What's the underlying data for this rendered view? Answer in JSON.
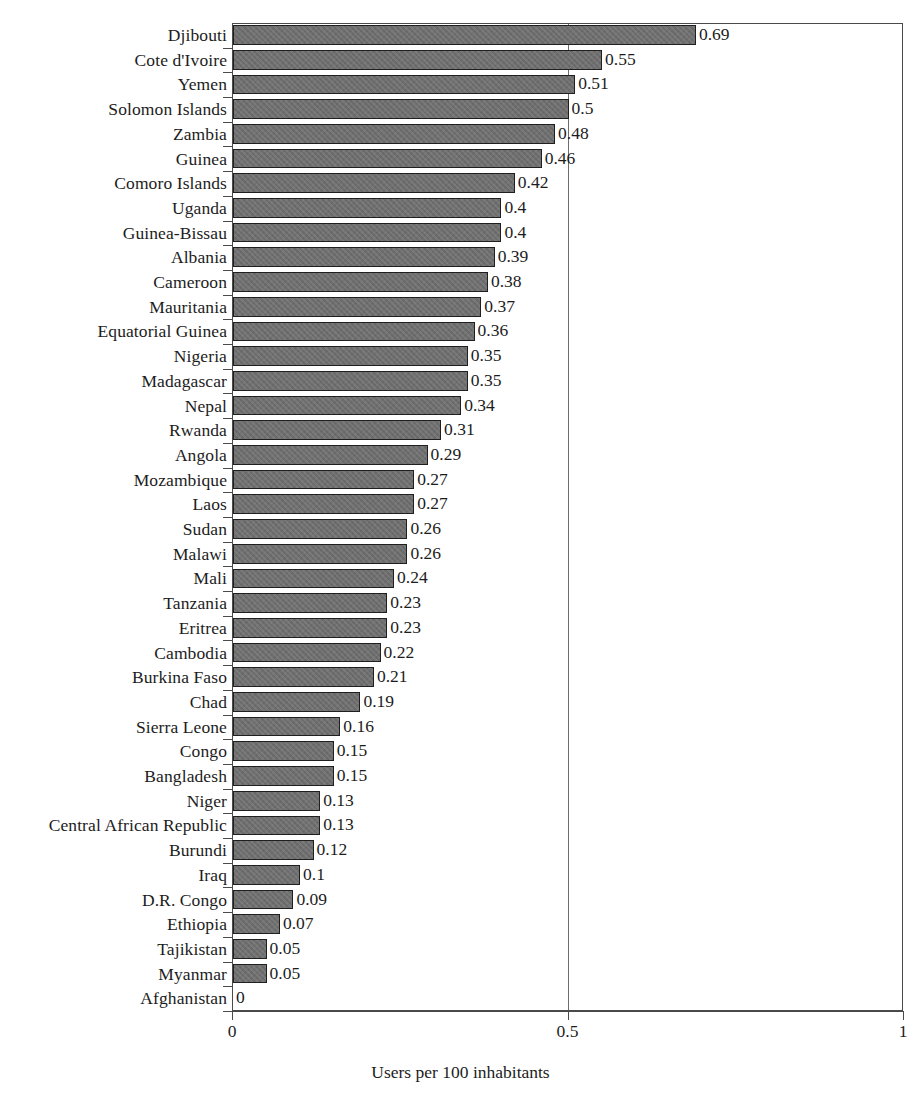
{
  "chart_data": {
    "type": "bar",
    "orientation": "horizontal",
    "title": "",
    "subtitle": "",
    "xlabel": "Users per 100 inhabitants",
    "ylabel": "",
    "xlim": [
      0,
      1
    ],
    "ylim": null,
    "grid": true,
    "gridlines_x": [
      0.5
    ],
    "legend": null,
    "legend_position": "none",
    "xticks": [
      0,
      0.5,
      1
    ],
    "xtick_labels": [
      "0",
      "0.5",
      "1"
    ],
    "bar_color": "#6e6e6e",
    "bar_edge_color": "#1f1f1f",
    "categories": [
      "Djibouti",
      "Cote d'Ivoire",
      "Yemen",
      "Solomon Islands",
      "Zambia",
      "Guinea",
      "Comoro Islands",
      "Uganda",
      "Guinea-Bissau",
      "Albania",
      "Cameroon",
      "Mauritania",
      "Equatorial Guinea",
      "Nigeria",
      "Madagascar",
      "Nepal",
      "Rwanda",
      "Angola",
      "Mozambique",
      "Laos",
      "Sudan",
      "Malawi",
      "Mali",
      "Tanzania",
      "Eritrea",
      "Cambodia",
      "Burkina Faso",
      "Chad",
      "Sierra Leone",
      "Congo",
      "Bangladesh",
      "Niger",
      "Central African Republic",
      "Burundi",
      "Iraq",
      "D.R. Congo",
      "Ethiopia",
      "Tajikistan",
      "Myanmar",
      "Afghanistan"
    ],
    "values": [
      0.69,
      0.55,
      0.51,
      0.5,
      0.48,
      0.46,
      0.42,
      0.4,
      0.4,
      0.39,
      0.38,
      0.37,
      0.36,
      0.35,
      0.35,
      0.34,
      0.31,
      0.29,
      0.27,
      0.27,
      0.26,
      0.26,
      0.24,
      0.23,
      0.23,
      0.22,
      0.21,
      0.19,
      0.16,
      0.15,
      0.15,
      0.13,
      0.13,
      0.12,
      0.1,
      0.09,
      0.07,
      0.05,
      0.05,
      0
    ],
    "value_labels": [
      "0.69",
      "0.55",
      "0.51",
      "0.5",
      "0.48",
      "0.46",
      "0.42",
      "0.4",
      "0.4",
      "0.39",
      "0.38",
      "0.37",
      "0.36",
      "0.35",
      "0.35",
      "0.34",
      "0.31",
      "0.29",
      "0.27",
      "0.27",
      "0.26",
      "0.26",
      "0.24",
      "0.23",
      "0.23",
      "0.22",
      "0.21",
      "0.19",
      "0.16",
      "0.15",
      "0.15",
      "0.13",
      "0.13",
      "0.12",
      "0.1",
      "0.09",
      "0.07",
      "0.05",
      "0.05",
      "0"
    ]
  }
}
